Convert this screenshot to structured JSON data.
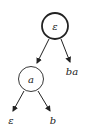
{
  "diagram": {
    "type": "tree",
    "nodes": [
      {
        "id": "root",
        "label": "ε",
        "shape": "circle",
        "emphasis": "bold"
      },
      {
        "id": "a",
        "label": "a",
        "shape": "circle"
      },
      {
        "id": "ba",
        "label": "ba",
        "shape": "text"
      },
      {
        "id": "eps_leaf",
        "label": "ε",
        "shape": "text"
      },
      {
        "id": "b",
        "label": "b",
        "shape": "text"
      }
    ],
    "edges": [
      {
        "from": "root",
        "to": "a"
      },
      {
        "from": "root",
        "to": "ba"
      },
      {
        "from": "a",
        "to": "eps_leaf"
      },
      {
        "from": "a",
        "to": "b"
      }
    ]
  },
  "labels": {
    "root": "ε",
    "a": "a",
    "ba": "ba",
    "eps_leaf": "ε",
    "b": "b"
  },
  "colors": {
    "stroke": "#222222",
    "background": "#ffffff"
  }
}
